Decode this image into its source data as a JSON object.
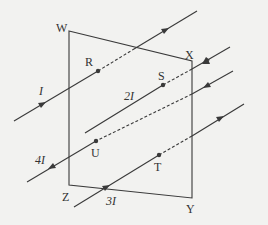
{
  "diagram": {
    "type": "wires through square loop",
    "corners": {
      "W": "W",
      "X": "X",
      "Y": "Y",
      "Z": "Z"
    },
    "points": {
      "R": "R",
      "S": "S",
      "T": "T",
      "U": "U"
    },
    "currents": {
      "r": "I",
      "s": "2I",
      "u": "4I",
      "t": "3I"
    },
    "colors": {
      "line": "#3a3a3a",
      "background": "#f2f2f0"
    }
  }
}
